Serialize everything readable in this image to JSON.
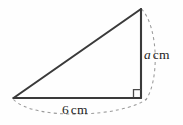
{
  "figure": {
    "kind": "right-triangle-diagram",
    "background_color": "#fefefe",
    "edge_color": "#3a3a3a",
    "arc_color": "#9a9a9a",
    "text_color": "#1d1d1d",
    "vertices": {
      "left": {
        "x": 13,
        "y": 98
      },
      "bottom_right": {
        "x": 141,
        "y": 98
      },
      "top": {
        "x": 141,
        "y": 9
      }
    },
    "right_angle": {
      "at_vertex": "bottom_right",
      "marker_size": 8
    },
    "labels": {
      "vertical_side": {
        "variable": "a",
        "unit": "cm",
        "italic_variable": true
      },
      "base_side": {
        "value": "6",
        "unit": "cm",
        "italic_variable": false
      }
    },
    "dimension_arcs": [
      {
        "name": "vertical-dimension-arc",
        "from": {
          "x": 141,
          "y": 9
        },
        "to": {
          "x": 144,
          "y": 99
        },
        "bulge": "right"
      },
      {
        "name": "base-dimension-arc",
        "from": {
          "x": 13,
          "y": 99
        },
        "to": {
          "x": 146,
          "y": 99
        },
        "bulge": "down"
      }
    ]
  }
}
